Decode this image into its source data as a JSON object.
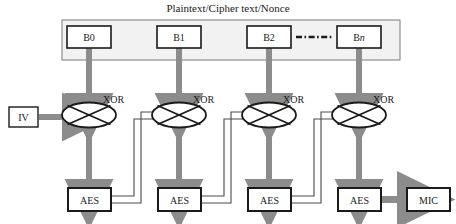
{
  "diagram": {
    "title": "Plaintext/Cipher text/Nonce",
    "colors": {
      "arrow_gray": "#8c8c8c",
      "container_fill": "#f2f2f2",
      "container_stroke": "#7a7a7a",
      "box_stroke": "#1a1a1a",
      "text": "#1a1a1a",
      "feedback_stroke": "#4a4a4a",
      "background": "#ffffff"
    },
    "input_block": {
      "name": "plaintext-container",
      "blocks": [
        {
          "label": "B0"
        },
        {
          "label": "B1"
        },
        {
          "label": "B2"
        },
        {
          "label": "B",
          "suffix": "n"
        }
      ],
      "ellipsis": "-  -  -  -  -"
    },
    "iv": {
      "label": "IV"
    },
    "xor_label": "XOR",
    "stages": [
      {
        "xor": "XOR",
        "cipher": "AES"
      },
      {
        "xor": "XOR",
        "cipher": "AES"
      },
      {
        "xor": "XOR",
        "cipher": "AES"
      },
      {
        "xor": "XOR",
        "cipher": "AES"
      }
    ],
    "output": {
      "label": "MIC"
    }
  }
}
